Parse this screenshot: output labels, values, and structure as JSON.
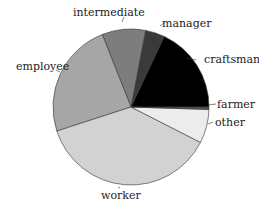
{
  "chart_data": {
    "type": "pie",
    "title": "",
    "start_angle_deg": 0,
    "direction": "counterclockwise",
    "slices": [
      {
        "label": "craftsman",
        "value": 18,
        "color": "#000000"
      },
      {
        "label": "manager",
        "value": 4,
        "color": "#3a3a3a"
      },
      {
        "label": "intermediate",
        "value": 9,
        "color": "#7d7d7d"
      },
      {
        "label": "employee",
        "value": 24,
        "color": "#a6a6a6"
      },
      {
        "label": "worker",
        "value": 37.5,
        "color": "#d2d2d2"
      },
      {
        "label": "other",
        "value": 7,
        "color": "#ececec"
      },
      {
        "label": "farmer",
        "value": 0.5,
        "color": "#555555"
      }
    ]
  },
  "labels": {
    "craftsman": "craftsman",
    "manager": "manager",
    "intermediate": "intermediate",
    "employee": "employee",
    "worker": "worker",
    "other": "other",
    "farmer": "farmer"
  }
}
